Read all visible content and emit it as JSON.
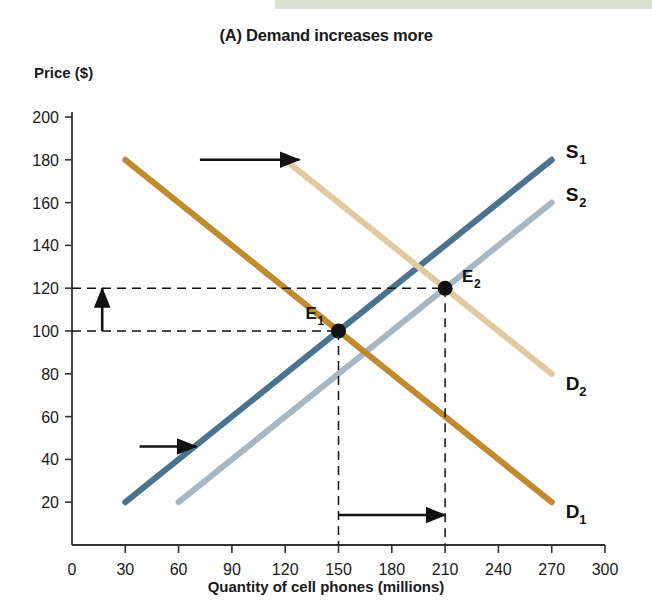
{
  "figure": {
    "title": "(A) Demand increases more",
    "top_band_color": "#d9e2d2"
  },
  "chart_data": {
    "type": "line",
    "title": "(A) Demand increases more",
    "xlabel": "Quantity of cell phones (millions)",
    "ylabel": "Price ($)",
    "xlim": [
      0,
      300
    ],
    "ylim": [
      0,
      200
    ],
    "xticks": [
      0,
      30,
      60,
      90,
      120,
      150,
      180,
      210,
      240,
      270,
      300
    ],
    "yticks": [
      20,
      40,
      60,
      80,
      100,
      120,
      140,
      160,
      180,
      200
    ],
    "grid": false,
    "legend": "inline-curve-labels",
    "series": [
      {
        "name": "S1",
        "label": "S",
        "subscript": "1",
        "role": "supply-original",
        "color": "#4a7390",
        "points": [
          [
            30,
            20
          ],
          [
            270,
            180
          ]
        ]
      },
      {
        "name": "S2",
        "label": "S",
        "subscript": "2",
        "role": "supply-new",
        "color": "#a9b7c2",
        "points": [
          [
            60,
            20
          ],
          [
            270,
            160
          ]
        ]
      },
      {
        "name": "D1",
        "label": "D",
        "subscript": "1",
        "role": "demand-original",
        "color": "#c08a2e",
        "points": [
          [
            30,
            180
          ],
          [
            270,
            20
          ]
        ]
      },
      {
        "name": "D2",
        "label": "D",
        "subscript": "2",
        "role": "demand-new",
        "color": "#e2c9a0",
        "points": [
          [
            120,
            180
          ],
          [
            270,
            80
          ]
        ]
      }
    ],
    "equilibria": [
      {
        "name": "E1",
        "label": "E",
        "subscript": "1",
        "x": 150,
        "y": 100
      },
      {
        "name": "E2",
        "label": "E",
        "subscript": "2",
        "x": 210,
        "y": 120
      }
    ],
    "annotations": [
      {
        "name": "demand-shift-arrow",
        "type": "arrow",
        "direction": "right",
        "from": [
          72,
          180
        ],
        "to": [
          128,
          180
        ]
      },
      {
        "name": "supply-shift-arrow",
        "type": "arrow",
        "direction": "right",
        "from": [
          38,
          46
        ],
        "to": [
          70,
          46
        ]
      },
      {
        "name": "price-increase-arrow",
        "type": "arrow",
        "direction": "up",
        "from": [
          17,
          100
        ],
        "to": [
          17,
          120
        ]
      },
      {
        "name": "quantity-increase-arrow",
        "type": "arrow",
        "direction": "right",
        "from": [
          150,
          14
        ],
        "to": [
          210,
          14
        ]
      }
    ]
  }
}
